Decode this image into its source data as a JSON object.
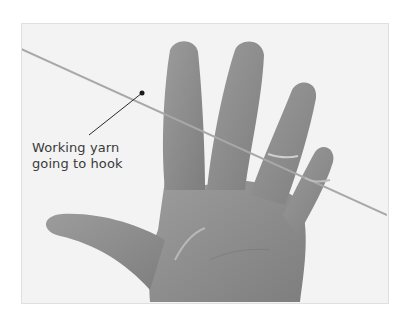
{
  "figure": {
    "annotation": {
      "line1": "Working yarn",
      "line2": "going to hook"
    },
    "colors": {
      "background": "#ffffff",
      "photo_bg": "#f3f3f3",
      "skin": "#8e8e8e",
      "yarn": "#a8a8a8",
      "leader": "#2a2a2a",
      "text": "#3a3a3a"
    }
  }
}
